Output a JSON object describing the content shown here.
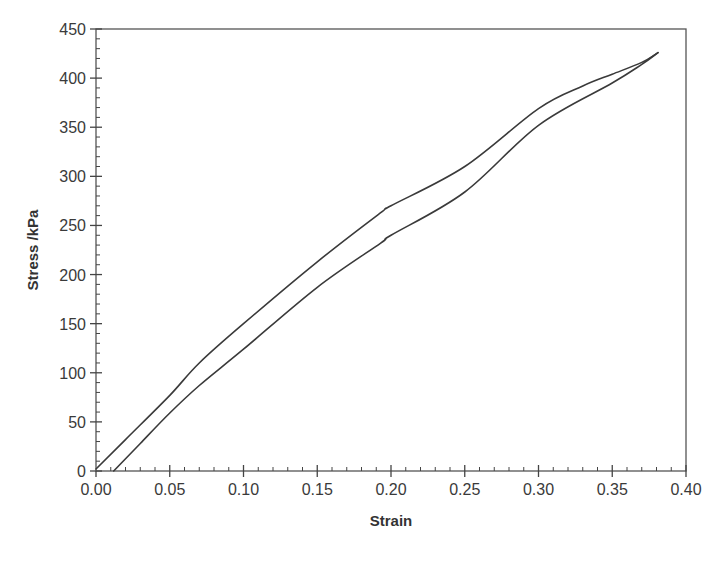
{
  "chart_data": {
    "type": "line",
    "title": "",
    "xlabel": "Strain",
    "ylabel": "Stress /kPa",
    "xlim": [
      0.0,
      0.4
    ],
    "ylim": [
      0,
      450
    ],
    "x_major_step": 0.05,
    "x_minor_step": 0.01,
    "y_major_step": 50,
    "y_minor_step": 10,
    "x_tick_labels": [
      "0.00",
      "0.05",
      "0.10",
      "0.15",
      "0.20",
      "0.25",
      "0.30",
      "0.35",
      "0.40"
    ],
    "y_tick_labels": [
      "0",
      "50",
      "100",
      "150",
      "200",
      "250",
      "300",
      "350",
      "400",
      "450"
    ],
    "grid": false,
    "legend": null,
    "line_color": "#3a3a3a",
    "series": [
      {
        "name": "Loading",
        "x": [
          0.0,
          0.02,
          0.05,
          0.07,
          0.1,
          0.15,
          0.193,
          0.2,
          0.25,
          0.3,
          0.33,
          0.35,
          0.37,
          0.381
        ],
        "y": [
          2,
          32,
          77,
          110,
          150,
          213,
          263,
          270,
          310,
          369,
          392,
          404,
          416,
          426
        ]
      },
      {
        "name": "Unloading",
        "x": [
          0.381,
          0.37,
          0.35,
          0.3,
          0.25,
          0.2,
          0.193,
          0.15,
          0.1,
          0.07,
          0.05,
          0.03,
          0.012
        ],
        "y": [
          426,
          414,
          395,
          352,
          284,
          240,
          232,
          187,
          124,
          87,
          59,
          28,
          0
        ]
      }
    ]
  }
}
